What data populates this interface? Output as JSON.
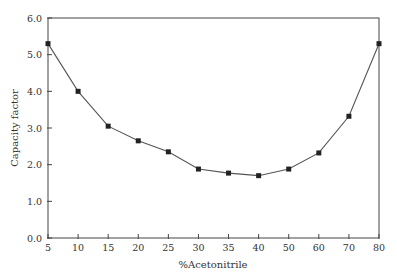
{
  "chart_data": {
    "type": "line",
    "title": "",
    "xlabel": "%Acetonitrile",
    "ylabel": "Capacity factor",
    "categories": [
      "5",
      "10",
      "15",
      "20",
      "25",
      "30",
      "35",
      "40",
      "50",
      "60",
      "70",
      "80"
    ],
    "series": [
      {
        "name": "Capacity factor",
        "values": [
          5.3,
          4.0,
          3.05,
          2.65,
          2.35,
          1.88,
          1.77,
          1.7,
          1.88,
          2.32,
          3.32,
          5.3
        ],
        "marker": "square",
        "color": "#222222"
      }
    ],
    "ylim": [
      0,
      6
    ],
    "yticks": [
      "0.0",
      "1.0",
      "2.0",
      "3.0",
      "4.0",
      "5.0",
      "6.0"
    ],
    "grid": false,
    "legend": null
  }
}
